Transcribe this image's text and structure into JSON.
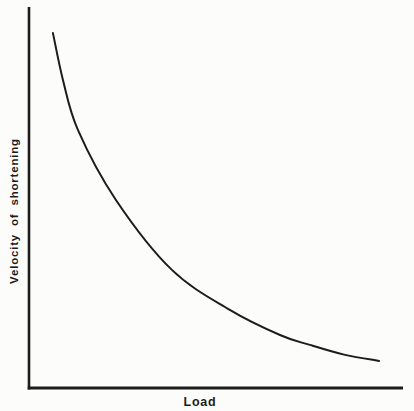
{
  "figure": {
    "background": "#fcfcfa",
    "ink": "#1c1c1c"
  },
  "chart_data": {
    "type": "line",
    "title": "",
    "xlabel": "Load",
    "ylabel": "Velocity of shortening",
    "x_range": [
      0,
      1
    ],
    "y_range": [
      0,
      1
    ],
    "x_ticks": [],
    "y_ticks": [],
    "grid": false,
    "legend": false,
    "series": [
      {
        "name": "force-velocity-curve",
        "points": [
          [
            0.064,
            0.932
          ],
          [
            0.091,
            0.808
          ],
          [
            0.131,
            0.677
          ],
          [
            0.233,
            0.493
          ],
          [
            0.382,
            0.31
          ],
          [
            0.537,
            0.205
          ],
          [
            0.671,
            0.139
          ],
          [
            0.751,
            0.113
          ],
          [
            0.845,
            0.087
          ],
          [
            0.936,
            0.071
          ]
        ]
      }
    ]
  }
}
